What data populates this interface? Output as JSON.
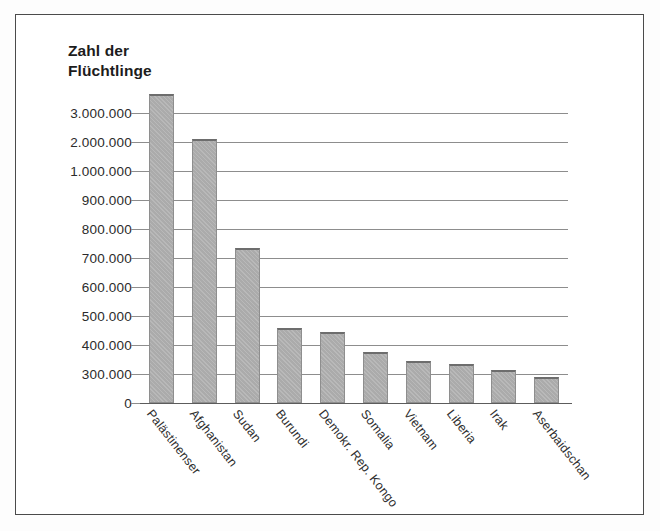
{
  "chart_data": {
    "type": "bar",
    "title": "Zahl der\nFlüchtlinge",
    "xlabel": "",
    "ylabel": "Zahl der Flüchtlinge",
    "grid": true,
    "legend": "none",
    "axis_note": "non-linear (broken) y-axis: 0, then 300.000 in 100.000 steps to 1.000.000, then 2.000.000 and 3.000.000",
    "ytick_labels": [
      "3.000.000",
      "2.000.000",
      "1.000.000",
      "900.000",
      "800.000",
      "700.000",
      "600.000",
      "500.000",
      "400.000",
      "300.000",
      "0"
    ],
    "ytick_values": [
      3000000,
      2000000,
      1000000,
      900000,
      800000,
      700000,
      600000,
      500000,
      400000,
      300000,
      0
    ],
    "categories": [
      "Palästinenser",
      "Afghanistan",
      "Sudan",
      "Burundi",
      "Demokr. Rep. Kongo",
      "Somalia",
      "Vietnam",
      "Liberia",
      "Irak",
      "Aserbaidschan"
    ],
    "values": [
      3650000,
      2100000,
      735000,
      460000,
      445000,
      375000,
      345000,
      335000,
      315000,
      270000
    ],
    "value_labels": [
      "3.650.000",
      "2.100.000",
      "735.000",
      "460.000",
      "445.000",
      "375.000",
      "345.000",
      "335.000",
      "315.000",
      "270.000"
    ],
    "colors": {
      "bar_fill": "#ababab",
      "bar_edge": "#8e8e8e",
      "bar_top_edge": "#6d6d6d",
      "gridline": "#8d8d8d",
      "axis": "#5c5c5c",
      "text": "#2b2b2b",
      "frame": "#4b4b4b",
      "background": "#ffffff"
    }
  }
}
